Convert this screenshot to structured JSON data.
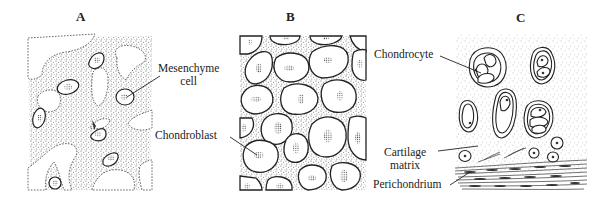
{
  "figure": {
    "panels": [
      {
        "id": "A",
        "title": "A",
        "subject": "Mesenchyme",
        "labels": [
          {
            "text_line1": "Mesenchyme",
            "text_line2": "cell"
          }
        ]
      },
      {
        "id": "B",
        "title": "B",
        "subject": "Chondroblasts",
        "labels": [
          {
            "text_line1": "Chondroblast"
          }
        ]
      },
      {
        "id": "C",
        "title": "C",
        "subject": "Hyaline cartilage",
        "labels": [
          {
            "text_line1": "Chondrocyte"
          },
          {
            "text_line1": "Cartilage",
            "text_line2": "matrix"
          },
          {
            "text_line1": "Perichondrium"
          }
        ]
      }
    ],
    "colors": {
      "ink": "#222222",
      "stipple": "#555555",
      "background": "#ffffff"
    }
  }
}
